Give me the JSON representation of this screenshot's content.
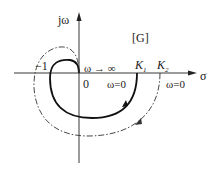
{
  "diagram": {
    "type": "nyquist-plot",
    "axes": {
      "vertical_label": "jω",
      "horizontal_label": "σ",
      "origin_label": "0"
    },
    "region_label": "[G]",
    "point_labels": {
      "minus_one": "−1",
      "k1": "K",
      "k1_sub": "1",
      "k2": "K",
      "k2_sub": "2"
    },
    "annotations": {
      "omega_infinity": "ω → ∞",
      "omega_zero_inner": "ω=0",
      "omega_zero_outer": "ω=0"
    },
    "curves": [
      {
        "name": "inner-solid",
        "start_point": "K1",
        "end": "origin",
        "style": "solid",
        "color": "#111111"
      },
      {
        "name": "outer-dashed",
        "start_point": "K2",
        "end": "origin",
        "style": "dash-dot",
        "color": "#333333"
      }
    ]
  }
}
